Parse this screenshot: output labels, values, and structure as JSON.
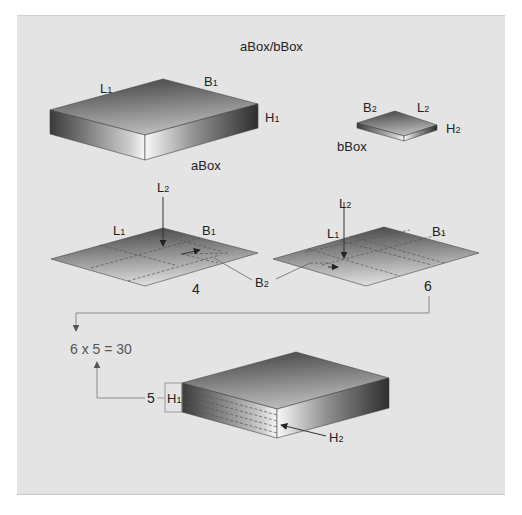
{
  "diagram": {
    "title": "aBox/bBox",
    "a_box": {
      "name": "aBox",
      "labels": {
        "length": "L",
        "length_sub": "1",
        "breadth": "B",
        "breadth_sub": "1",
        "height": "H",
        "height_sub": "1"
      }
    },
    "b_box": {
      "name": "bBox",
      "labels": {
        "breadth": "B",
        "breadth_sub": "2",
        "length": "L",
        "length_sub": "2",
        "height": "H",
        "height_sub": "2"
      }
    },
    "layout_1": {
      "labels": {
        "l2": "L",
        "l2_sub": "2",
        "l1": "L",
        "l1_sub": "1",
        "b1": "B",
        "b1_sub": "1",
        "b2": "B",
        "b2_sub": "2"
      },
      "count": "4"
    },
    "layout_2": {
      "labels": {
        "l2": "L",
        "l2_sub": "2",
        "l1": "L",
        "l1_sub": "1",
        "b1": "B",
        "b1_sub": "1"
      },
      "count": "6"
    },
    "calculation": {
      "expression": "6 x 5 = 30",
      "factor_a": 6,
      "factor_b": 5,
      "result": 30
    },
    "stack": {
      "layers_count": "5",
      "labels": {
        "h1": "H",
        "h1_sub": "1",
        "h2": "H",
        "h2_sub": "2"
      }
    },
    "colors": {
      "panel_bg": "#e4e4e4",
      "dark_gray": "#4a4a4a",
      "light_gray": "#f2f2f2",
      "connector": "#8a8a8a"
    }
  }
}
